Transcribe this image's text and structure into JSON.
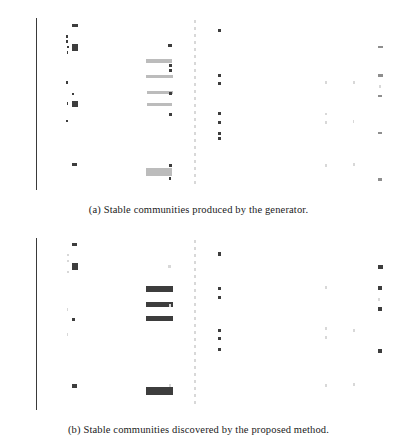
{
  "figure": {
    "subfigures": [
      {
        "id": "subfig-a",
        "caption": "(a) Stable communities produced by the generator."
      },
      {
        "id": "subfig-b",
        "caption": "(b) Stable communities discovered by the proposed method."
      }
    ]
  },
  "chart_data": [
    {
      "type": "scatter",
      "title": "",
      "subfigure": "a",
      "caption": "(a) Stable communities produced by the generator.",
      "xlabel": "",
      "ylabel": "",
      "xlim": [
        -250,
        5400
      ],
      "ylim": [
        0,
        60
      ],
      "grid": false,
      "legend": null,
      "x_ticks": [
        0,
        1000,
        2000,
        3000,
        4000,
        5000
      ],
      "x_tick_labels": [
        "0",
        "1000",
        "2000",
        "3000",
        "4000",
        "5000"
      ],
      "y_tick_count": 58,
      "y_tick_labels_legible": false,
      "notes": "Dense unreadable micro-text y-axis category labels; marks are squares and horizontal runs of squares (communities across node-id ranges).",
      "marks": [
        {
          "x": 330,
          "y": 57.4,
          "w": 95,
          "h": 1.0,
          "shade": "dark"
        },
        {
          "x": 245,
          "y": 53.6,
          "w": 30,
          "h": 0.9,
          "shade": "dark"
        },
        {
          "x": 245,
          "y": 51.8,
          "w": 30,
          "h": 0.9,
          "shade": "dark"
        },
        {
          "x": 252,
          "y": 49.9,
          "w": 32,
          "h": 0.9,
          "shade": "dark"
        },
        {
          "x": 330,
          "y": 49.7,
          "w": 100,
          "h": 2.3,
          "shade": "dark"
        },
        {
          "x": 246,
          "y": 48.0,
          "w": 30,
          "h": 0.9,
          "shade": "dark"
        },
        {
          "x": 2700,
          "y": 55.7,
          "w": 60,
          "h": 1.0,
          "shade": "dark"
        },
        {
          "x": 1900,
          "y": 50.3,
          "w": 55,
          "h": 1.0,
          "shade": "dark"
        },
        {
          "x": 5300,
          "y": 49.9,
          "w": 80,
          "h": 1.0,
          "shade": "mid"
        },
        {
          "x": 1530,
          "y": 45.0,
          "w": 430,
          "h": 1.1,
          "shade": "light"
        },
        {
          "x": 1905,
          "y": 43.3,
          "w": 55,
          "h": 1.0,
          "shade": "dark"
        },
        {
          "x": 1905,
          "y": 41.6,
          "w": 55,
          "h": 1.0,
          "shade": "dark"
        },
        {
          "x": 1540,
          "y": 39.6,
          "w": 430,
          "h": 1.1,
          "shade": "light"
        },
        {
          "x": 2700,
          "y": 40.0,
          "w": 58,
          "h": 1.0,
          "shade": "dark"
        },
        {
          "x": 5310,
          "y": 40.0,
          "w": 70,
          "h": 1.0,
          "shade": "mid"
        },
        {
          "x": 244,
          "y": 37.6,
          "w": 30,
          "h": 0.9,
          "shade": "dark"
        },
        {
          "x": 2700,
          "y": 37.2,
          "w": 58,
          "h": 1.0,
          "shade": "dark"
        },
        {
          "x": 4450,
          "y": 37.5,
          "w": 30,
          "h": 1.0,
          "shade": "faint"
        },
        {
          "x": 4900,
          "y": 37.5,
          "w": 20,
          "h": 1.0,
          "shade": "faint"
        },
        {
          "x": 5320,
          "y": 36.0,
          "w": 25,
          "h": 1.0,
          "shade": "faint"
        },
        {
          "x": 1545,
          "y": 34.0,
          "w": 430,
          "h": 1.1,
          "shade": "light"
        },
        {
          "x": 1905,
          "y": 33.6,
          "w": 55,
          "h": 1.0,
          "shade": "dark"
        },
        {
          "x": 5300,
          "y": 32.8,
          "w": 70,
          "h": 1.0,
          "shade": "mid"
        },
        {
          "x": 328,
          "y": 33.5,
          "w": 45,
          "h": 1.0,
          "shade": "dark"
        },
        {
          "x": 1545,
          "y": 29.7,
          "w": 420,
          "h": 1.1,
          "shade": "light"
        },
        {
          "x": 248,
          "y": 30.2,
          "w": 28,
          "h": 0.9,
          "shade": "dark"
        },
        {
          "x": 330,
          "y": 30.0,
          "w": 95,
          "h": 2.2,
          "shade": "dark"
        },
        {
          "x": 1905,
          "y": 26.3,
          "w": 50,
          "h": 1.0,
          "shade": "dark"
        },
        {
          "x": 2700,
          "y": 26.8,
          "w": 58,
          "h": 1.0,
          "shade": "dark"
        },
        {
          "x": 4450,
          "y": 26.5,
          "w": 28,
          "h": 1.0,
          "shade": "faint"
        },
        {
          "x": 244,
          "y": 24.1,
          "w": 28,
          "h": 0.9,
          "shade": "dark"
        },
        {
          "x": 2700,
          "y": 23.4,
          "w": 58,
          "h": 1.0,
          "shade": "dark"
        },
        {
          "x": 4450,
          "y": 23.6,
          "w": 28,
          "h": 1.0,
          "shade": "faint"
        },
        {
          "x": 4890,
          "y": 23.8,
          "w": 20,
          "h": 1.0,
          "shade": "faint"
        },
        {
          "x": 2700,
          "y": 19.7,
          "w": 58,
          "h": 1.0,
          "shade": "dark"
        },
        {
          "x": 5300,
          "y": 19.9,
          "w": 65,
          "h": 1.0,
          "shade": "mid"
        },
        {
          "x": 2700,
          "y": 17.9,
          "w": 58,
          "h": 1.0,
          "shade": "dark"
        },
        {
          "x": 330,
          "y": 8.8,
          "w": 90,
          "h": 1.2,
          "shade": "dark"
        },
        {
          "x": 1905,
          "y": 8.6,
          "w": 50,
          "h": 1.0,
          "shade": "dark"
        },
        {
          "x": 4450,
          "y": 8.5,
          "w": 28,
          "h": 1.0,
          "shade": "faint"
        },
        {
          "x": 4900,
          "y": 8.9,
          "w": 20,
          "h": 1.0,
          "shade": "faint"
        },
        {
          "x": 1530,
          "y": 6.4,
          "w": 430,
          "h": 2.8,
          "shade": "light"
        },
        {
          "x": 1903,
          "y": 4.0,
          "w": 45,
          "h": 1.0,
          "shade": "dark"
        },
        {
          "x": 5300,
          "y": 3.8,
          "w": 65,
          "h": 1.0,
          "shade": "mid"
        }
      ],
      "dashed_vline_x": 2320
    },
    {
      "type": "scatter",
      "title": "",
      "subfigure": "b",
      "caption": "(b) Stable communities discovered by the proposed method.",
      "xlabel": "",
      "ylabel": "",
      "xlim": [
        -250,
        5400
      ],
      "ylim": [
        0,
        60
      ],
      "grid": false,
      "legend": null,
      "x_ticks": [
        0,
        1000,
        2000,
        3000,
        4000,
        5000
      ],
      "x_tick_labels": [
        "0",
        "1000",
        "2000",
        "3000",
        "4000",
        "5000"
      ],
      "y_tick_count": 58,
      "y_tick_labels_legible": false,
      "notes": "Same layout as (a) but detected communities appear as darker, thicker horizontal bars; fewer faint light-gray runs.",
      "marks": [
        {
          "x": 330,
          "y": 57.8,
          "w": 90,
          "h": 1.2,
          "shade": "dark"
        },
        {
          "x": 250,
          "y": 54.0,
          "w": 28,
          "h": 0.9,
          "shade": "faint"
        },
        {
          "x": 250,
          "y": 52.0,
          "w": 28,
          "h": 0.9,
          "shade": "faint"
        },
        {
          "x": 330,
          "y": 50.2,
          "w": 95,
          "h": 2.4,
          "shade": "dark"
        },
        {
          "x": 250,
          "y": 48.2,
          "w": 28,
          "h": 0.9,
          "shade": "faint"
        },
        {
          "x": 2700,
          "y": 54.4,
          "w": 60,
          "h": 1.1,
          "shade": "dark"
        },
        {
          "x": 1900,
          "y": 50.0,
          "w": 45,
          "h": 1.0,
          "shade": "faint"
        },
        {
          "x": 5300,
          "y": 50.0,
          "w": 80,
          "h": 1.3,
          "shade": "dark"
        },
        {
          "x": 1530,
          "y": 42.2,
          "w": 440,
          "h": 2.0,
          "shade": "dark"
        },
        {
          "x": 2700,
          "y": 42.5,
          "w": 58,
          "h": 1.1,
          "shade": "dark"
        },
        {
          "x": 5300,
          "y": 42.6,
          "w": 72,
          "h": 1.3,
          "shade": "dark"
        },
        {
          "x": 4450,
          "y": 42.6,
          "w": 28,
          "h": 1.0,
          "shade": "faint"
        },
        {
          "x": 2700,
          "y": 39.3,
          "w": 58,
          "h": 1.1,
          "shade": "dark"
        },
        {
          "x": 1530,
          "y": 36.8,
          "w": 440,
          "h": 2.0,
          "shade": "dark"
        },
        {
          "x": 1905,
          "y": 36.6,
          "w": 40,
          "h": 1.0,
          "shade": "faint"
        },
        {
          "x": 5300,
          "y": 35.2,
          "w": 72,
          "h": 1.3,
          "shade": "dark"
        },
        {
          "x": 5310,
          "y": 38.5,
          "w": 22,
          "h": 1.0,
          "shade": "faint"
        },
        {
          "x": 250,
          "y": 35.0,
          "w": 26,
          "h": 0.9,
          "shade": "faint"
        },
        {
          "x": 1540,
          "y": 31.9,
          "w": 430,
          "h": 1.8,
          "shade": "dark"
        },
        {
          "x": 330,
          "y": 31.5,
          "w": 48,
          "h": 1.2,
          "shade": "dark"
        },
        {
          "x": 2700,
          "y": 27.8,
          "w": 58,
          "h": 1.1,
          "shade": "dark"
        },
        {
          "x": 4450,
          "y": 28.4,
          "w": 28,
          "h": 1.0,
          "shade": "faint"
        },
        {
          "x": 4900,
          "y": 27.6,
          "w": 20,
          "h": 1.0,
          "shade": "faint"
        },
        {
          "x": 250,
          "y": 26.4,
          "w": 26,
          "h": 0.9,
          "shade": "faint"
        },
        {
          "x": 2700,
          "y": 25.0,
          "w": 58,
          "h": 1.1,
          "shade": "dark"
        },
        {
          "x": 4450,
          "y": 25.2,
          "w": 28,
          "h": 1.0,
          "shade": "faint"
        },
        {
          "x": 2700,
          "y": 21.0,
          "w": 58,
          "h": 1.1,
          "shade": "dark"
        },
        {
          "x": 5300,
          "y": 20.6,
          "w": 65,
          "h": 1.2,
          "shade": "dark"
        },
        {
          "x": 330,
          "y": 8.4,
          "w": 88,
          "h": 1.3,
          "shade": "dark"
        },
        {
          "x": 1530,
          "y": 6.6,
          "w": 440,
          "h": 3.0,
          "shade": "dark"
        },
        {
          "x": 1905,
          "y": 8.6,
          "w": 40,
          "h": 1.0,
          "shade": "faint"
        },
        {
          "x": 4450,
          "y": 8.4,
          "w": 28,
          "h": 1.0,
          "shade": "faint"
        },
        {
          "x": 4900,
          "y": 8.8,
          "w": 20,
          "h": 1.0,
          "shade": "faint"
        }
      ],
      "dashed_vline_x": 2320
    }
  ]
}
